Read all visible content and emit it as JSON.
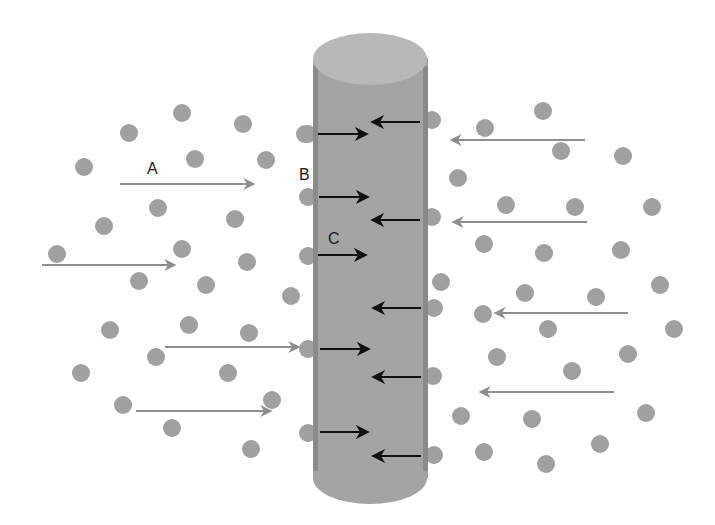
{
  "diagram": {
    "labels": {
      "A": "A",
      "B": "B",
      "C": "C"
    },
    "colors": {
      "particle": "#a0a0a0",
      "cylinder_body": "#a4a4a4",
      "cylinder_edge": "#8a8a8a",
      "cylinder_top": "#b8b8b8",
      "outside_arrow": "#8e8e8e",
      "inside_arrow": "#111111"
    },
    "cylinder": {
      "x": 313,
      "y_top": 58,
      "width": 115,
      "y_bottom": 490
    },
    "particles": [
      [
        182,
        113
      ],
      [
        243,
        124
      ],
      [
        129,
        133
      ],
      [
        305,
        134
      ],
      [
        84,
        167
      ],
      [
        195,
        159
      ],
      [
        266,
        160
      ],
      [
        158,
        208
      ],
      [
        235,
        219
      ],
      [
        104,
        226
      ],
      [
        182,
        249
      ],
      [
        57,
        254
      ],
      [
        247,
        262
      ],
      [
        139,
        281
      ],
      [
        206,
        285
      ],
      [
        291,
        296
      ],
      [
        110,
        330
      ],
      [
        189,
        325
      ],
      [
        249,
        333
      ],
      [
        156,
        357
      ],
      [
        81,
        373
      ],
      [
        228,
        373
      ],
      [
        272,
        400
      ],
      [
        123,
        405
      ],
      [
        172,
        428
      ],
      [
        251,
        449
      ],
      [
        308,
        134
      ],
      [
        308,
        197
      ],
      [
        308,
        256
      ],
      [
        308,
        349
      ],
      [
        308,
        433
      ],
      [
        432,
        120
      ],
      [
        485,
        128
      ],
      [
        543,
        111
      ],
      [
        561,
        151
      ],
      [
        623,
        156
      ],
      [
        458,
        178
      ],
      [
        432,
        217
      ],
      [
        506,
        205
      ],
      [
        575,
        207
      ],
      [
        652,
        207
      ],
      [
        484,
        244
      ],
      [
        544,
        253
      ],
      [
        621,
        250
      ],
      [
        441,
        282
      ],
      [
        525,
        293
      ],
      [
        596,
        297
      ],
      [
        660,
        285
      ],
      [
        434,
        308
      ],
      [
        483,
        314
      ],
      [
        548,
        329
      ],
      [
        674,
        329
      ],
      [
        497,
        357
      ],
      [
        572,
        371
      ],
      [
        628,
        354
      ],
      [
        433,
        376
      ],
      [
        461,
        416
      ],
      [
        532,
        419
      ],
      [
        646,
        413
      ],
      [
        484,
        452
      ],
      [
        546,
        464
      ],
      [
        600,
        444
      ],
      [
        434,
        455
      ]
    ],
    "outside_arrows_right": [
      {
        "x1": 120,
        "y1": 184,
        "x2": 253,
        "y2": 184
      },
      {
        "x1": 42,
        "y1": 265,
        "x2": 174,
        "y2": 265
      },
      {
        "x1": 165,
        "y1": 347,
        "x2": 298,
        "y2": 347
      },
      {
        "x1": 136,
        "y1": 411,
        "x2": 270,
        "y2": 411
      }
    ],
    "outside_arrows_left": [
      {
        "x1": 585,
        "y1": 140,
        "x2": 452,
        "y2": 140
      },
      {
        "x1": 587,
        "y1": 222,
        "x2": 454,
        "y2": 222
      },
      {
        "x1": 628,
        "y1": 313,
        "x2": 496,
        "y2": 313
      },
      {
        "x1": 614,
        "y1": 392,
        "x2": 481,
        "y2": 392
      }
    ],
    "inside_arrows_right": [
      {
        "x1": 318,
        "y1": 134,
        "x2": 366,
        "y2": 134
      },
      {
        "x1": 319,
        "y1": 197,
        "x2": 367,
        "y2": 197
      },
      {
        "x1": 318,
        "y1": 255,
        "x2": 365,
        "y2": 255
      },
      {
        "x1": 320,
        "y1": 349,
        "x2": 368,
        "y2": 349
      },
      {
        "x1": 320,
        "y1": 432,
        "x2": 367,
        "y2": 432
      }
    ],
    "inside_arrows_left": [
      {
        "x1": 420,
        "y1": 122,
        "x2": 373,
        "y2": 122
      },
      {
        "x1": 420,
        "y1": 220,
        "x2": 373,
        "y2": 220
      },
      {
        "x1": 421,
        "y1": 308,
        "x2": 374,
        "y2": 308
      },
      {
        "x1": 421,
        "y1": 377,
        "x2": 374,
        "y2": 377
      },
      {
        "x1": 421,
        "y1": 456,
        "x2": 374,
        "y2": 456
      }
    ]
  }
}
